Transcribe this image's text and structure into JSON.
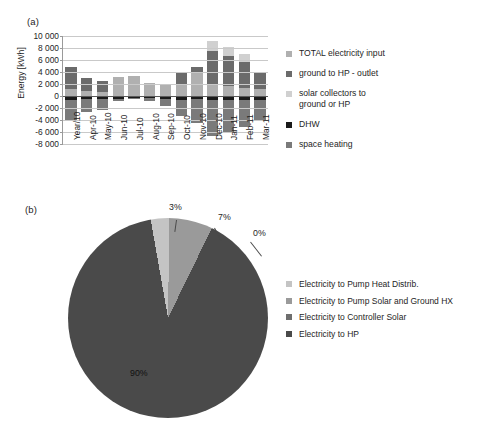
{
  "figure": {
    "panel_a_label": "(a)",
    "panel_b_label": "(b)"
  },
  "chart_data": [
    {
      "type": "bar",
      "panel": "(a)",
      "title": "",
      "xlabel": "",
      "ylabel": "Energy [kWh]",
      "ylim": [
        -8000,
        10000
      ],
      "ytick_labels": [
        "10 000",
        "8 000",
        "6 000",
        "4 000",
        "2 000",
        "0",
        "-2 000",
        "-4 000",
        "-6 000",
        "-8 000"
      ],
      "ytick_values": [
        10000,
        8000,
        6000,
        4000,
        2000,
        0,
        -2000,
        -4000,
        -6000,
        -8000
      ],
      "grid": true,
      "legend_position": "right",
      "stacked": true,
      "categories": [
        "Year/10",
        "Apr-10",
        "May-10",
        "Jun-10",
        "Jul-10",
        "Aug-10",
        "Sep-10",
        "Oct-10",
        "Nov-10",
        "Dec-10",
        "Jan-11",
        "Feb-11",
        "Mar-11"
      ],
      "series": [
        {
          "name": "TOTAL electricity input",
          "color": "#b0b0b0",
          "values": [
            1150,
            800,
            750,
            3250,
            3350,
            2100,
            1850,
            1900,
            3950,
            1850,
            1650,
            1350,
            1200
          ]
        },
        {
          "name": "ground to HP - outlet",
          "color": "#6b6b6b",
          "values": [
            3750,
            2150,
            1750,
            0,
            0,
            0,
            0,
            2000,
            950,
            5600,
            4950,
            4350,
            2850
          ]
        },
        {
          "name": "solar collectors to ground or HP",
          "color": "#d0d0d0",
          "values": [
            0,
            0,
            0,
            0,
            0,
            0,
            100,
            0,
            0,
            1800,
            1550,
            1350,
            0
          ]
        },
        {
          "name": "DHW",
          "color": "#1a1a1a",
          "values": [
            -600,
            -500,
            -520,
            -480,
            -300,
            -350,
            -430,
            -600,
            -580,
            -620,
            -600,
            -600,
            -600
          ]
        },
        {
          "name": "space heating",
          "color": "#7a7a7a",
          "values": [
            -3400,
            -2100,
            -1800,
            -350,
            -80,
            -500,
            -1300,
            -2700,
            -3900,
            -6100,
            -5400,
            -4600,
            -3450
          ]
        }
      ]
    },
    {
      "type": "pie",
      "panel": "(b)",
      "title": "",
      "legend_position": "right",
      "labels": [
        "Electricity to Pump Heat Distrib.",
        "Electricity to Pump Solar and Ground HX",
        "Electricity to Controller Solar",
        "Electricity to HP"
      ],
      "values": [
        3,
        7,
        0,
        90
      ],
      "value_labels": [
        "3%",
        "7%",
        "0%",
        "90%"
      ],
      "colors": [
        "#c4c4c4",
        "#9a9a9a",
        "#6e6e6e",
        "#4a4a4a"
      ]
    }
  ],
  "chart_a": {
    "ylabel": "Energy [kWh]",
    "yticks": [
      "10 000",
      "8 000",
      "6 000",
      "4 000",
      "2 000",
      "0",
      "-2 000",
      "-4 000",
      "-6 000",
      "-8 000"
    ],
    "xticks": [
      "Year/10",
      "Apr-10",
      "May-10",
      "Jun-10",
      "Jul-10",
      "Aug-10",
      "Sep-10",
      "Oct-10",
      "Nov-10",
      "Dec-10",
      "Jan-11",
      "Feb-11",
      "Mar-11"
    ],
    "legend": [
      {
        "label": "TOTAL electricity input",
        "color": "#b0b0b0"
      },
      {
        "label": "ground to HP - outlet",
        "color": "#6b6b6b"
      },
      {
        "label": "solar collectors to\nground or HP",
        "color": "#d0d0d0"
      },
      {
        "label": "DHW",
        "color": "#1a1a1a"
      },
      {
        "label": "space heating",
        "color": "#7a7a7a"
      }
    ]
  },
  "chart_b": {
    "pct_labels": [
      "3%",
      "7%",
      "0%",
      "90%"
    ],
    "legend": [
      {
        "label": "Electricity to Pump Heat Distrib.",
        "color": "#c4c4c4"
      },
      {
        "label": "Electricity to Pump Solar and Ground HX",
        "color": "#9a9a9a"
      },
      {
        "label": "Electricity to Controller Solar",
        "color": "#6e6e6e"
      },
      {
        "label": "Electricity to HP",
        "color": "#4a4a4a"
      }
    ]
  }
}
